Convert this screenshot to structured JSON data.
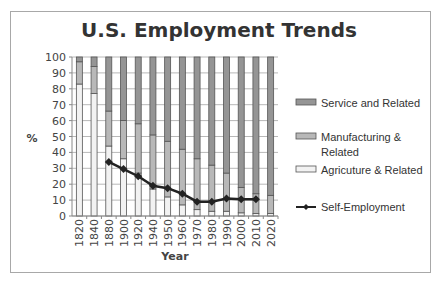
{
  "chart_data": {
    "type": "bar",
    "stacked": true,
    "title": "U.S. Employment Trends",
    "xlabel": "Year",
    "ylabel": "%",
    "ylim": [
      0,
      100
    ],
    "yticks": [
      0,
      10,
      20,
      30,
      40,
      50,
      60,
      70,
      80,
      90,
      100
    ],
    "grid": true,
    "legend_position": "right",
    "categories": [
      "1820",
      "1840",
      "1880",
      "1900",
      "1920",
      "1940",
      "1950",
      "1960",
      "1970",
      "1980",
      "1990",
      "2000",
      "2010",
      "2020"
    ],
    "series": [
      {
        "name": "Agricuture & Related",
        "type": "bar",
        "color": "#f2f2f2",
        "values": [
          83,
          77,
          44,
          36,
          27,
          17,
          12,
          7,
          4,
          3,
          3,
          2,
          1.5,
          1.5
        ]
      },
      {
        "name": "Manufacturing & Related",
        "type": "bar",
        "color": "#b8b8b8",
        "values": [
          14,
          17,
          22,
          24,
          31,
          34,
          35,
          35,
          32,
          29,
          24,
          16,
          12.5,
          11.5
        ]
      },
      {
        "name": "Service and Related",
        "type": "bar",
        "color": "#959595",
        "values": [
          3,
          6,
          34,
          40,
          42,
          49,
          53,
          58,
          64,
          68,
          73,
          82,
          86,
          87
        ]
      },
      {
        "name": "Self-Employment",
        "type": "line",
        "color": "#222222",
        "values": [
          null,
          null,
          34,
          29.5,
          25,
          19,
          17.5,
          14,
          9,
          9,
          11,
          10.5,
          10.5,
          null
        ]
      }
    ]
  },
  "legend": {
    "items": [
      {
        "label": "Service and Related",
        "kind": "bar",
        "color": "#959595"
      },
      {
        "label": "Manufacturing &",
        "label2": "Related",
        "kind": "bar",
        "color": "#b8b8b8"
      },
      {
        "label": "Agricuture & Related",
        "kind": "bar",
        "color": "#f2f2f2"
      },
      {
        "label": "Self-Employment",
        "kind": "line",
        "color": "#222222"
      }
    ]
  }
}
